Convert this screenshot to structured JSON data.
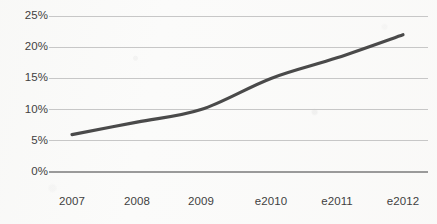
{
  "chart_data": {
    "type": "line",
    "title": "",
    "subtitle": "",
    "xlabel": "",
    "ylabel": "",
    "categories": [
      "2007",
      "2008",
      "2009",
      "e2010",
      "e2011",
      "e2012"
    ],
    "values": [
      6,
      8,
      10,
      15,
      18.3,
      22
    ],
    "series": [
      {
        "name": "",
        "values": [
          6,
          8,
          10,
          15,
          18.3,
          22
        ]
      }
    ],
    "ylim": [
      0,
      25
    ],
    "ytick_labels": [
      "0%",
      "5%",
      "10%",
      "15%",
      "20%",
      "25%"
    ],
    "ytick_values": [
      0,
      5,
      10,
      15,
      20,
      25
    ],
    "xtick_labels": [
      "2007",
      "2008",
      "2009",
      "e2010",
      "e2011",
      "e2012"
    ],
    "grid": true,
    "grid_axis": "y",
    "legend": false,
    "legend_position": "none",
    "smoothed": true,
    "annotations": []
  },
  "style": {
    "line_color": "#4a4a4a",
    "grid_color": "#c7c7c7",
    "axis_color": "#9a9a9a",
    "tick_text_color": "#3f3f3f",
    "background_color": "#fbfbfa",
    "line_width_px": 3.2
  },
  "axis": {
    "y_labels": [
      {
        "text": "25%",
        "value": 25
      },
      {
        "text": "20%",
        "value": 20
      },
      {
        "text": "15%",
        "value": 15
      },
      {
        "text": "10%",
        "value": 10
      },
      {
        "text": "5%",
        "value": 5
      },
      {
        "text": "0%",
        "value": 0
      }
    ],
    "x_labels": [
      {
        "text": "2007"
      },
      {
        "text": "2008"
      },
      {
        "text": "2009"
      },
      {
        "text": "e2010"
      },
      {
        "text": "e2011"
      },
      {
        "text": "e2012"
      }
    ]
  }
}
